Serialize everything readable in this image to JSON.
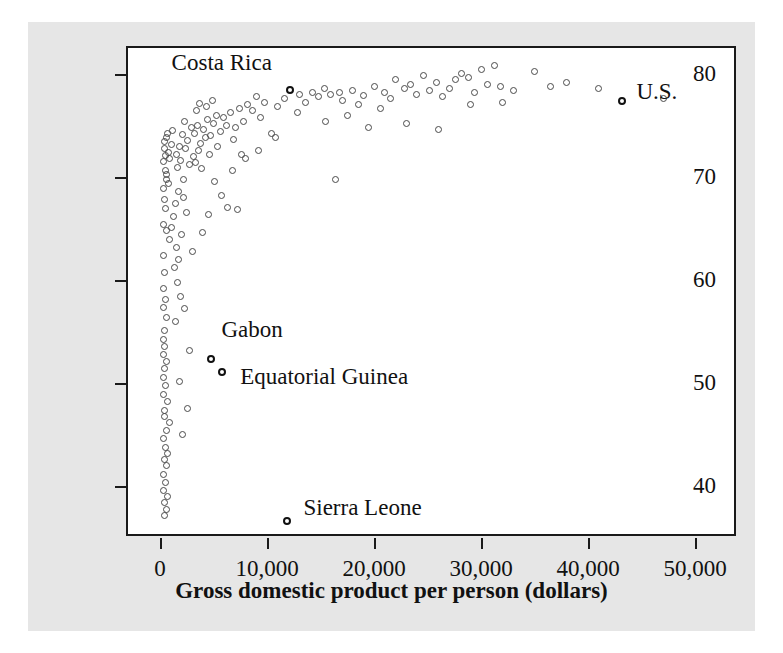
{
  "chart_data": {
    "type": "scatter",
    "title": "",
    "xlabel": "Gross domestic product per person (dollars)",
    "ylabel": "Life expectancy (years)",
    "xlim": [
      -3000,
      54000
    ],
    "ylim": [
      35,
      82.5
    ],
    "xticks": [
      0,
      10000,
      20000,
      30000,
      40000,
      50000
    ],
    "xticklabels": [
      "0",
      "10,000",
      "20,000",
      "30,000",
      "40,000",
      "50,000"
    ],
    "yticks": [
      40,
      50,
      60,
      70,
      80
    ],
    "yticklabels": [
      "40",
      "50",
      "60",
      "70",
      "80"
    ],
    "grid": false,
    "legend": null,
    "marker": "open-circle",
    "marker_color": "#4a4a4a",
    "background_color": "#e6e6e6",
    "plot_background_color": "#ffffff",
    "annotations": [
      {
        "label": "Costa Rica",
        "x": 12100,
        "y": 78.4,
        "dx": -118,
        "dy": -28
      },
      {
        "label": "U.S.",
        "x": 43200,
        "y": 77.4,
        "dx": 14,
        "dy": -10
      },
      {
        "label": "Gabon",
        "x": 4800,
        "y": 52.4,
        "dx": 10,
        "dy": -30
      },
      {
        "label": "Equatorial Guinea",
        "x": 5800,
        "y": 51.1,
        "dx": 18,
        "dy": 4
      },
      {
        "label": "Sierra Leone",
        "x": 11900,
        "y": 36.6,
        "dx": 16,
        "dy": -14
      }
    ],
    "points": [
      [
        11900,
        36.6
      ],
      [
        43200,
        77.4
      ],
      [
        12100,
        78.4
      ],
      [
        4800,
        52.4
      ],
      [
        5800,
        51.1
      ],
      [
        380,
        72.8
      ],
      [
        420,
        73.4
      ],
      [
        520,
        72.1
      ],
      [
        300,
        71.5
      ],
      [
        610,
        73.8
      ],
      [
        700,
        74.2
      ],
      [
        480,
        70.6
      ],
      [
        560,
        69.8
      ],
      [
        350,
        68.9
      ],
      [
        800,
        72.4
      ],
      [
        900,
        71.8
      ],
      [
        1050,
        73.1
      ],
      [
        1200,
        74.5
      ],
      [
        640,
        70.2
      ],
      [
        760,
        69.4
      ],
      [
        430,
        67.8
      ],
      [
        520,
        66.9
      ],
      [
        330,
        65.4
      ],
      [
        640,
        64.8
      ],
      [
        880,
        63.9
      ],
      [
        300,
        62.4
      ],
      [
        420,
        60.7
      ],
      [
        350,
        59.2
      ],
      [
        480,
        58.1
      ],
      [
        300,
        57.3
      ],
      [
        560,
        56.4
      ],
      [
        380,
        55.1
      ],
      [
        330,
        54.2
      ],
      [
        450,
        53.6
      ],
      [
        300,
        52.8
      ],
      [
        620,
        52.1
      ],
      [
        420,
        51.4
      ],
      [
        350,
        50.6
      ],
      [
        540,
        49.8
      ],
      [
        300,
        48.9
      ],
      [
        680,
        48.2
      ],
      [
        430,
        47.4
      ],
      [
        380,
        46.8
      ],
      [
        900,
        46.2
      ],
      [
        560,
        45.4
      ],
      [
        330,
        44.6
      ],
      [
        480,
        43.8
      ],
      [
        700,
        43.2
      ],
      [
        400,
        42.6
      ],
      [
        620,
        42.0
      ],
      [
        350,
        41.2
      ],
      [
        480,
        40.4
      ],
      [
        300,
        39.6
      ],
      [
        700,
        39.0
      ],
      [
        450,
        38.4
      ],
      [
        600,
        37.8
      ],
      [
        380,
        37.2
      ],
      [
        1500,
        72.2
      ],
      [
        1800,
        73.0
      ],
      [
        2100,
        74.1
      ],
      [
        1600,
        70.9
      ],
      [
        1900,
        71.6
      ],
      [
        2400,
        72.8
      ],
      [
        2200,
        69.8
      ],
      [
        1700,
        68.6
      ],
      [
        2600,
        73.5
      ],
      [
        2900,
        74.8
      ],
      [
        2300,
        75.4
      ],
      [
        2700,
        71.2
      ],
      [
        3100,
        72.0
      ],
      [
        1400,
        67.4
      ],
      [
        1250,
        66.2
      ],
      [
        1100,
        65.1
      ],
      [
        2000,
        64.4
      ],
      [
        1550,
        63.2
      ],
      [
        1750,
        62.0
      ],
      [
        2450,
        66.6
      ],
      [
        2150,
        68.0
      ],
      [
        1350,
        61.2
      ],
      [
        1650,
        59.8
      ],
      [
        1900,
        58.4
      ],
      [
        2250,
        57.2
      ],
      [
        1450,
        56.0
      ],
      [
        2700,
        53.2
      ],
      [
        1850,
        50.2
      ],
      [
        2550,
        47.6
      ],
      [
        2050,
        45.0
      ],
      [
        3200,
        74.2
      ],
      [
        3500,
        75.0
      ],
      [
        3800,
        73.2
      ],
      [
        4100,
        74.6
      ],
      [
        3300,
        71.4
      ],
      [
        3600,
        72.6
      ],
      [
        4400,
        75.6
      ],
      [
        4700,
        74.0
      ],
      [
        3900,
        70.8
      ],
      [
        4200,
        73.8
      ],
      [
        5000,
        75.2
      ],
      [
        5300,
        76.0
      ],
      [
        4600,
        72.2
      ],
      [
        5600,
        74.4
      ],
      [
        5900,
        75.8
      ],
      [
        3400,
        76.4
      ],
      [
        3700,
        77.1
      ],
      [
        4300,
        76.8
      ],
      [
        4900,
        77.4
      ],
      [
        5400,
        73.0
      ],
      [
        6200,
        75.0
      ],
      [
        6600,
        76.2
      ],
      [
        7000,
        74.8
      ],
      [
        7400,
        76.6
      ],
      [
        7800,
        75.4
      ],
      [
        6900,
        73.6
      ],
      [
        5100,
        69.6
      ],
      [
        4500,
        66.4
      ],
      [
        8200,
        77.0
      ],
      [
        8600,
        76.4
      ],
      [
        9000,
        77.8
      ],
      [
        9400,
        75.8
      ],
      [
        9800,
        77.2
      ],
      [
        10400,
        74.2
      ],
      [
        11000,
        76.8
      ],
      [
        11600,
        77.6
      ],
      [
        13000,
        78.0
      ],
      [
        13600,
        77.2
      ],
      [
        14200,
        78.2
      ],
      [
        14800,
        77.8
      ],
      [
        15400,
        78.6
      ],
      [
        15900,
        78.0
      ],
      [
        16400,
        69.8
      ],
      [
        15500,
        75.4
      ],
      [
        12800,
        76.2
      ],
      [
        17000,
        77.4
      ],
      [
        18000,
        78.4
      ],
      [
        19000,
        77.9
      ],
      [
        20000,
        78.8
      ],
      [
        21000,
        78.2
      ],
      [
        22000,
        79.4
      ],
      [
        22800,
        78.6
      ],
      [
        23400,
        79.0
      ],
      [
        24000,
        78.0
      ],
      [
        24600,
        79.8
      ],
      [
        25200,
        78.4
      ],
      [
        25800,
        79.2
      ],
      [
        26400,
        77.8
      ],
      [
        27000,
        78.6
      ],
      [
        27600,
        79.4
      ],
      [
        28200,
        80.0
      ],
      [
        28800,
        79.6
      ],
      [
        29400,
        78.2
      ],
      [
        30000,
        80.4
      ],
      [
        30600,
        79.0
      ],
      [
        31200,
        80.8
      ],
      [
        31800,
        78.8
      ],
      [
        20600,
        76.6
      ],
      [
        23000,
        75.2
      ],
      [
        26000,
        74.6
      ],
      [
        33000,
        78.4
      ],
      [
        35000,
        80.2
      ],
      [
        36500,
        78.8
      ],
      [
        38000,
        79.2
      ],
      [
        41000,
        78.6
      ],
      [
        47000,
        77.6
      ],
      [
        29000,
        77.0
      ],
      [
        32000,
        77.2
      ],
      [
        19500,
        74.8
      ],
      [
        17500,
        76.0
      ],
      [
        18500,
        77.0
      ],
      [
        21500,
        77.6
      ],
      [
        16800,
        78.2
      ],
      [
        10800,
        73.8
      ],
      [
        9200,
        72.6
      ],
      [
        8000,
        71.8
      ],
      [
        6800,
        70.6
      ],
      [
        7600,
        72.2
      ],
      [
        5700,
        68.2
      ],
      [
        6300,
        67.0
      ],
      [
        7200,
        66.8
      ],
      [
        4000,
        64.6
      ],
      [
        3000,
        62.8
      ]
    ]
  }
}
